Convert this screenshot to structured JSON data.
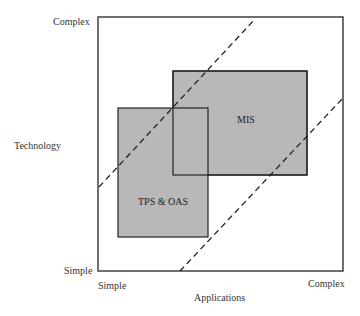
{
  "diagram": {
    "y_axis": {
      "title": "Technology",
      "top_label": "Complex",
      "bottom_label": "Simple"
    },
    "x_axis": {
      "title": "Applications",
      "left_label": "Simple",
      "right_label": "Complex"
    },
    "boxes": [
      {
        "label": "MIS",
        "fill": "#b8b8b8"
      },
      {
        "label": "TPS & OAS",
        "fill": "#b8b8b8"
      }
    ],
    "colors": {
      "frame": "#333333",
      "box_fill": "#b8b8b8",
      "dashed_line": "#222222",
      "background": "#ffffff"
    }
  }
}
